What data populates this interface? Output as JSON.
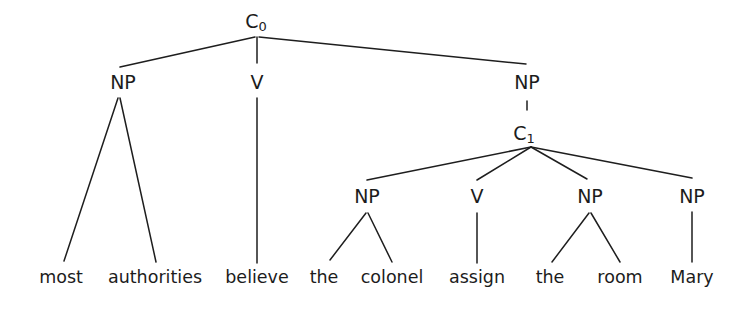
{
  "tree": {
    "root": {
      "label": "C",
      "sub": "0"
    },
    "level1": [
      {
        "label": "NP"
      },
      {
        "label": "V"
      },
      {
        "label": "NP"
      }
    ],
    "embedded": {
      "label": "C",
      "sub": "1"
    },
    "level3": [
      {
        "label": "NP"
      },
      {
        "label": "V"
      },
      {
        "label": "NP"
      },
      {
        "label": "NP"
      }
    ],
    "words": [
      "most",
      "authorities",
      "believe",
      "the",
      "colonel",
      "assign",
      "the",
      "room",
      "Mary"
    ]
  }
}
